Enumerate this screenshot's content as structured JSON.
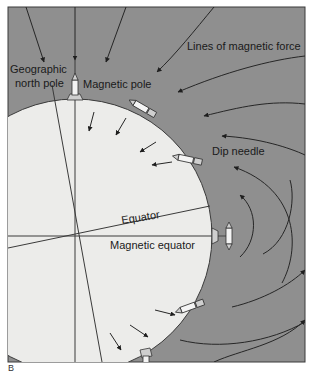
{
  "figure": {
    "labels": {
      "geographic_north_pole_line1": "Geographic",
      "geographic_north_pole_line2": "north pole",
      "magnetic_pole": "Magnetic pole",
      "lines_of_magnetic_force": "Lines of magnetic force",
      "dip_needle": "Dip needle",
      "equator": "Equator",
      "magnetic_equator": "Magnetic equator"
    },
    "panel_letter": "B",
    "colors": {
      "background_field": "#8f8f8f",
      "earth": "#ececea",
      "lines": "#2a2a2a",
      "frame": "#3a3a3a"
    }
  }
}
